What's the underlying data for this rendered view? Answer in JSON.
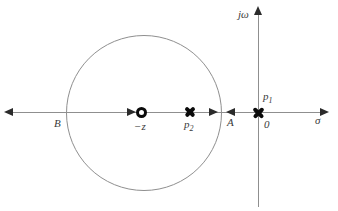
{
  "diagram": {
    "type": "root-locus-pole-zero-plot",
    "axis_labels": {
      "horizontal": "σ",
      "vertical": "jω"
    },
    "origin_label": "0",
    "markers": {
      "zero": {
        "label": "−z",
        "shape": "circle-outline"
      },
      "pole1": {
        "base": "p",
        "sub": "1",
        "shape": "bold-cross"
      },
      "pole2": {
        "base": "p",
        "sub": "2",
        "shape": "bold-cross"
      }
    },
    "break_points": {
      "A": "A",
      "B": "B"
    },
    "colors": {
      "background": "#ffffff",
      "axis": "#8f8f8f",
      "circle": "#8f8f8f",
      "arrow": "#2b2b2b",
      "marker": "#0a0a0a",
      "label": "#3a3a3a"
    }
  }
}
